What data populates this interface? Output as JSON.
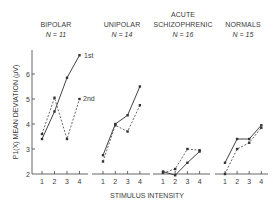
{
  "chart_data": {
    "type": "line",
    "title": "",
    "ylabel": "P1(X) MEAN DEVIATION (μV)",
    "xlabel": "STIMULUS INTENSITY",
    "ylim": [
      2,
      7
    ],
    "yticks": [
      2,
      3,
      4,
      5,
      6
    ],
    "xticks": [
      1,
      2,
      3,
      4
    ],
    "grid": false,
    "series_labels": [
      "1st",
      "2nd"
    ],
    "panels": [
      {
        "title": "BIPOLAR",
        "n_label": "N = 11",
        "x": [
          1,
          2,
          3,
          4
        ],
        "series": [
          {
            "name": "1st",
            "style": "solid",
            "values": [
              3.4,
              4.5,
              5.85,
              6.75
            ]
          },
          {
            "name": "2nd",
            "style": "dashed",
            "values": [
              3.6,
              5.05,
              3.4,
              5.0
            ]
          }
        ]
      },
      {
        "title": "UNIPOLAR",
        "n_label": "N = 14",
        "x": [
          1,
          2,
          3,
          4
        ],
        "series": [
          {
            "name": "1st",
            "style": "solid",
            "values": [
              2.75,
              4.0,
              4.35,
              5.5
            ]
          },
          {
            "name": "2nd",
            "style": "dashed",
            "values": [
              2.5,
              3.95,
              3.7,
              4.75
            ]
          }
        ]
      },
      {
        "title": "ACUTE SCHIZOPHRENIC",
        "n_label": "N = 16",
        "x": [
          1,
          2,
          3,
          4
        ],
        "series": [
          {
            "name": "1st",
            "style": "solid",
            "values": [
              2.1,
              1.95,
              2.45,
              2.9
            ]
          },
          {
            "name": "2nd",
            "style": "dashed",
            "values": [
              2.05,
              2.2,
              3.0,
              2.95
            ]
          }
        ]
      },
      {
        "title": "NORMALS",
        "n_label": "N = 15",
        "x": [
          1,
          2,
          3,
          4
        ],
        "series": [
          {
            "name": "1st",
            "style": "solid",
            "values": [
              2.45,
              3.4,
              3.4,
              3.95
            ]
          },
          {
            "name": "2nd",
            "style": "dashed",
            "values": [
              2.0,
              3.0,
              3.25,
              3.85
            ]
          }
        ]
      }
    ]
  },
  "labels": {
    "panel_titles": [
      "BIPOLAR",
      "UNIPOLAR",
      "ACUTE",
      "SCHIZOPHRENIC",
      "NORMALS"
    ],
    "n_labels": [
      "N = 11",
      "N = 14",
      "N = 16",
      "N = 15"
    ],
    "ylabel": "P1(X) MEAN DEVIATION (μV)",
    "xlabel": "STIMULUS INTENSITY",
    "series_1st": "1st",
    "series_2nd": "2nd"
  }
}
